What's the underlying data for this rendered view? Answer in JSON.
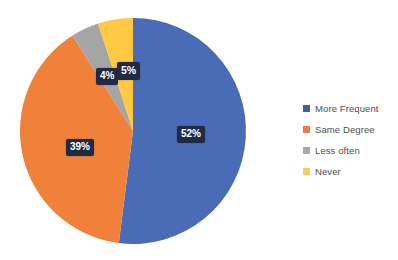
{
  "chart_data": {
    "type": "pie",
    "title": "",
    "xlabel": "",
    "ylabel": "",
    "legend_position": "right",
    "grid": false,
    "categories": [
      "More Frequent",
      "Same Degree",
      "Less often",
      "Never"
    ],
    "values": [
      52,
      39,
      4,
      5
    ],
    "value_labels": [
      "52%",
      "39%",
      "4%",
      "5%"
    ],
    "colors": [
      "#4a6bb5",
      "#f0813a",
      "#a5a5a5",
      "#ffc944"
    ],
    "slices": [
      {
        "label": "More Frequent",
        "value": 52,
        "display": "52%",
        "color": "#4a6bb5"
      },
      {
        "label": "Same Degree",
        "value": 39,
        "display": "39%",
        "color": "#f0813a"
      },
      {
        "label": "Less often",
        "value": 4,
        "display": "4%",
        "color": "#a5a5a5"
      },
      {
        "label": "Never",
        "value": 5,
        "display": "5%",
        "color": "#ffc944"
      }
    ]
  },
  "legend": {
    "items": [
      {
        "label": "More Frequent",
        "color": "#41619b"
      },
      {
        "label": "Same Degree",
        "color": "#ed7d45"
      },
      {
        "label": "Less often",
        "color": "#a8a8a8"
      },
      {
        "label": "Never",
        "color": "#f5cf62"
      }
    ]
  },
  "labels": {
    "blue": "52%",
    "orange": "39%",
    "gray": "4%",
    "yellow": "5%"
  },
  "theme": {
    "background": "#ffffff",
    "label_box": "#1f2b45",
    "label_text": "#ffffff",
    "legend_text": "#4d4d4d"
  }
}
